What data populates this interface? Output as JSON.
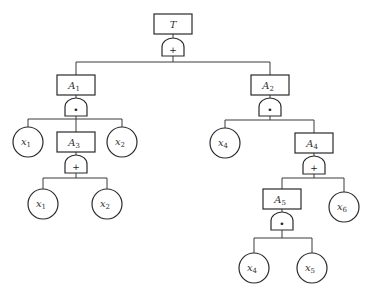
{
  "diagram": {
    "type": "fault-tree",
    "nodes": {
      "T": {
        "letter": "T",
        "sub": ""
      },
      "A1": {
        "letter": "A",
        "sub": "1"
      },
      "A2": {
        "letter": "A",
        "sub": "2"
      },
      "A3": {
        "letter": "A",
        "sub": "3"
      },
      "A4": {
        "letter": "A",
        "sub": "4"
      },
      "A5": {
        "letter": "A",
        "sub": "5"
      },
      "x1a": {
        "letter": "x",
        "sub": "1"
      },
      "x2a": {
        "letter": "x",
        "sub": "2"
      },
      "x1b": {
        "letter": "x",
        "sub": "1"
      },
      "x2b": {
        "letter": "x",
        "sub": "2"
      },
      "x4a": {
        "letter": "x",
        "sub": "4"
      },
      "x6": {
        "letter": "x",
        "sub": "6"
      },
      "x4b": {
        "letter": "x",
        "sub": "4"
      },
      "x5": {
        "letter": "x",
        "sub": "5"
      }
    },
    "gates": {
      "gT": {
        "type": "OR",
        "symbol": "+"
      },
      "gA1": {
        "type": "AND",
        "symbol": "•"
      },
      "gA2": {
        "type": "AND",
        "symbol": "•"
      },
      "gA3": {
        "type": "OR",
        "symbol": "+"
      },
      "gA4": {
        "type": "OR",
        "symbol": "+"
      },
      "gA5": {
        "type": "AND",
        "symbol": "•"
      }
    },
    "edges": [
      [
        "T",
        "A1"
      ],
      [
        "T",
        "A2"
      ],
      [
        "A1",
        "x1a"
      ],
      [
        "A1",
        "A3"
      ],
      [
        "A1",
        "x2a"
      ],
      [
        "A3",
        "x1b"
      ],
      [
        "A3",
        "x2b"
      ],
      [
        "A2",
        "x4a"
      ],
      [
        "A2",
        "A4"
      ],
      [
        "A4",
        "A5"
      ],
      [
        "A4",
        "x6"
      ],
      [
        "A5",
        "x4b"
      ],
      [
        "A5",
        "x5"
      ]
    ]
  }
}
